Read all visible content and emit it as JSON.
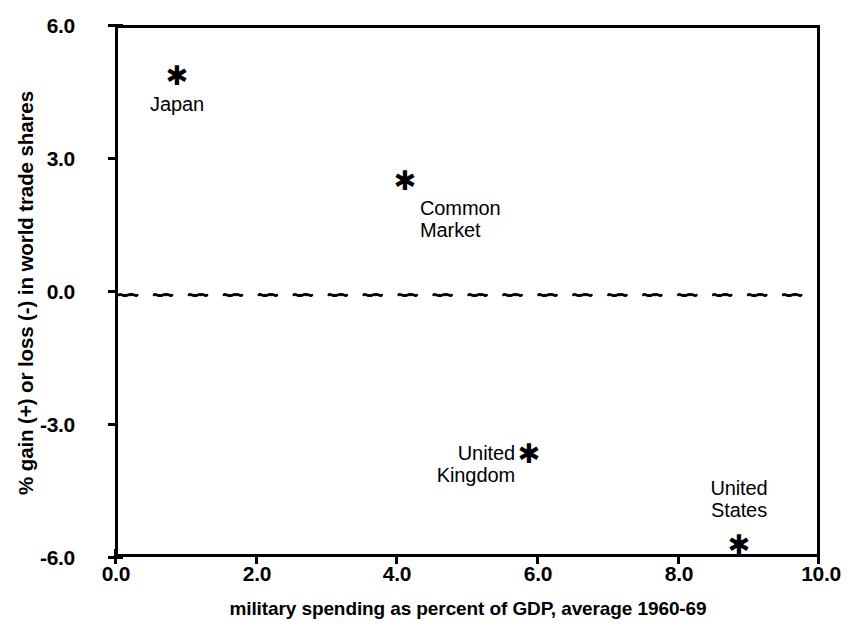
{
  "chart_data": {
    "type": "scatter",
    "title": "",
    "xlabel": "military spending as percent of GDP, average 1960-69",
    "ylabel": "% gain (+) or loss (-) in world trade shares",
    "xlim": [
      0.0,
      10.0
    ],
    "ylim": [
      -6.0,
      6.0
    ],
    "xticks": [
      "0.0",
      "2.0",
      "4.0",
      "6.0",
      "8.0",
      "10.0"
    ],
    "xtick_values": [
      0.0,
      2.0,
      4.0,
      6.0,
      8.0,
      10.0
    ],
    "yticks": [
      "6.0",
      "3.0",
      "0.0",
      "-3.0",
      "-6.0"
    ],
    "ytick_values": [
      6.0,
      3.0,
      0.0,
      -3.0,
      -6.0
    ],
    "grid": false,
    "legend": "none",
    "reference_lines": [
      {
        "axis": "y",
        "value": 0.0,
        "style": "wavy-dashed"
      }
    ],
    "points": [
      {
        "label": "Japan",
        "x": 0.85,
        "y": 4.9,
        "marker": "asterisk"
      },
      {
        "label": "Common\nMarket",
        "x": 4.1,
        "y": 2.55,
        "marker": "asterisk"
      },
      {
        "label": "United\nKingdom",
        "x": 5.85,
        "y": -3.45,
        "marker": "asterisk"
      },
      {
        "label": "United\nStates",
        "x": 8.85,
        "y": -5.7,
        "marker": "asterisk"
      }
    ]
  },
  "markers": {
    "glyph": "✱",
    "japan": "✱",
    "common_market": "✱",
    "united_kingdom": "✱",
    "united_states": "✱"
  },
  "labels": {
    "japan": "Japan",
    "common_market_line1": "Common",
    "common_market_line2": "Market",
    "united_kingdom_line1": "United",
    "united_kingdom_line2": "Kingdom",
    "united_states_line1": "United",
    "united_states_line2": "States"
  },
  "axes": {
    "y_title": "% gain (+) or loss (-) in world trade shares",
    "x_title": "military spending as percent of GDP, average 1960-69",
    "y_tick_0": "6.0",
    "y_tick_1": "3.0",
    "y_tick_2": "0.0",
    "y_tick_3": "-3.0",
    "y_tick_4": "-6.0",
    "x_tick_0": "0.0",
    "x_tick_1": "2.0",
    "x_tick_2": "4.0",
    "x_tick_3": "6.0",
    "x_tick_4": "8.0",
    "x_tick_5": "10.0"
  },
  "colors": {
    "ink": "#000000",
    "background": "#ffffff"
  }
}
